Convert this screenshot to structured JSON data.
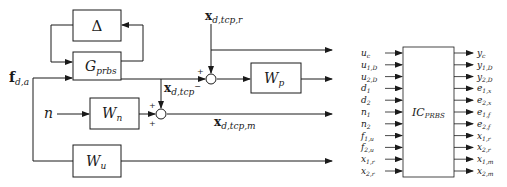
{
  "left_diagram": {
    "blocks": {
      "delta": {
        "label": "Δ"
      },
      "g_prbs": {
        "label": "G",
        "sub": "prbs"
      },
      "w_p": {
        "label": "W",
        "sub": "p"
      },
      "w_n": {
        "label": "W",
        "sub": "n"
      },
      "w_u": {
        "label": "W",
        "sub": "u"
      }
    },
    "signals": {
      "f_da": {
        "label": "f",
        "sub": "d,a"
      },
      "n": {
        "label": "n"
      },
      "x_dtcp_r": {
        "label": "x",
        "sub": "d,tcp,r"
      },
      "x_dtcp": {
        "label": "x",
        "sub": "d,tcp",
        "sup": "−"
      },
      "x_dtcp_m": {
        "label": "x",
        "sub": "d,tcp,m"
      }
    },
    "summers": {
      "top": {
        "signs": [
          "+",
          "−"
        ]
      },
      "bottom": {
        "signs": [
          "+",
          "+"
        ]
      }
    }
  },
  "right_diagram": {
    "block": {
      "label": "IC",
      "sub": "PRBS"
    },
    "inputs": [
      {
        "main": "u",
        "sub": "c"
      },
      {
        "main": "u",
        "sub": "1,D"
      },
      {
        "main": "u",
        "sub": "2,D"
      },
      {
        "main": "d",
        "sub": "1"
      },
      {
        "main": "d",
        "sub": "2"
      },
      {
        "main": "n",
        "sub": "1"
      },
      {
        "main": "n",
        "sub": "2"
      },
      {
        "main": "f",
        "sub": "1,u"
      },
      {
        "main": "f",
        "sub": "2,u"
      },
      {
        "main": "x",
        "sub": "1,r"
      },
      {
        "main": "x",
        "sub": "2,r"
      }
    ],
    "outputs": [
      {
        "main": "y",
        "sub": "c"
      },
      {
        "main": "y",
        "sub": "1,D"
      },
      {
        "main": "y",
        "sub": "2,D"
      },
      {
        "main": "e",
        "sub": "1,x"
      },
      {
        "main": "e",
        "sub": "2,x"
      },
      {
        "main": "e",
        "sub": "1,f"
      },
      {
        "main": "e",
        "sub": "2,f"
      },
      {
        "main": "x",
        "sub": "1,r"
      },
      {
        "main": "x",
        "sub": "2,r"
      },
      {
        "main": "x",
        "sub": "1,m"
      },
      {
        "main": "x",
        "sub": "2,m"
      }
    ]
  }
}
